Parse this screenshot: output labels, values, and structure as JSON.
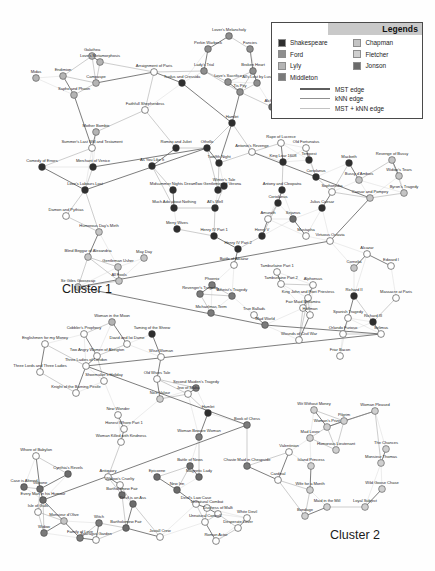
{
  "figure": {
    "type": "network-graph",
    "background": "#fefefe"
  },
  "legend": {
    "title": "Legends",
    "authors": [
      {
        "name": "Shakespeare",
        "color": "#2e2e2e"
      },
      {
        "name": "Ford",
        "color": "#8e8e8e"
      },
      {
        "name": "Lyly",
        "color": "#b4b4b4"
      },
      {
        "name": "Middleton",
        "color": "#7a7a7a"
      },
      {
        "name": "Chapman",
        "color": "#c4c4c4"
      },
      {
        "name": "Fletcher",
        "color": "#cfcfcf"
      },
      {
        "name": "Jonson",
        "color": "#6b6b6b"
      }
    ],
    "edges": [
      {
        "label": "MST edge",
        "color": "#5e5e5e"
      },
      {
        "label": "kNN edge",
        "color": "#8f8f8f"
      },
      {
        "label": "MST + kNN edge",
        "color": "#c2c2c2"
      }
    ]
  },
  "clusters": [
    {
      "label": "Cluster 1"
    },
    {
      "label": "Cluster 2"
    }
  ],
  "chart_data": {
    "type": "scatter",
    "title": "",
    "xlabel": "",
    "ylabel": "",
    "nodes": [
      {
        "label": "Galathea",
        "x": 92,
        "y": 56,
        "group": "Lyly"
      },
      {
        "label": "Love's Metamorphosis",
        "x": 100,
        "y": 62,
        "group": "Lyly"
      },
      {
        "label": "Endimion",
        "x": 63,
        "y": 76,
        "group": "Lyly"
      },
      {
        "label": "Midas",
        "x": 36,
        "y": 78,
        "group": "Lyly"
      },
      {
        "label": "Campaspe",
        "x": 96,
        "y": 83,
        "group": "Lyly"
      },
      {
        "label": "Sapho and Phaon",
        "x": 74,
        "y": 95,
        "group": "Lyly"
      },
      {
        "label": "Lover's Melancholy",
        "x": 229,
        "y": 36,
        "group": "Ford"
      },
      {
        "label": "Perkin Warbeck",
        "x": 208,
        "y": 49,
        "group": "Ford"
      },
      {
        "label": "Fancies",
        "x": 250,
        "y": 49,
        "group": "Ford"
      },
      {
        "label": "Lady's Trial",
        "x": 204,
        "y": 71,
        "group": "Ford"
      },
      {
        "label": "Broken Heart",
        "x": 253,
        "y": 71,
        "group": "Ford"
      },
      {
        "label": "Love's Sacrifice",
        "x": 228,
        "y": 82,
        "group": "Ford"
      },
      {
        "label": "All's Lost by Lust",
        "x": 257,
        "y": 83,
        "group": "Ford"
      },
      {
        "label": "Tis Pity",
        "x": 240,
        "y": 92,
        "group": "Ford"
      },
      {
        "label": "Arraignment of Paris",
        "x": 154,
        "y": 72,
        "group": "Other"
      },
      {
        "label": "Troilus and Cressida",
        "x": 182,
        "y": 83,
        "group": "Shakespeare"
      },
      {
        "label": "Faithfull Shepherdess",
        "x": 145,
        "y": 110,
        "group": "Other"
      },
      {
        "label": "Alcharist",
        "x": 272,
        "y": 107,
        "group": "Jonson"
      },
      {
        "label": "Hamlet",
        "x": 232,
        "y": 123,
        "group": "Shakespeare"
      },
      {
        "label": "Mother Bombie",
        "x": 96,
        "y": 132,
        "group": "Lyly"
      },
      {
        "label": "Summer's Last Will and Testament",
        "x": 92,
        "y": 148,
        "group": "Other"
      },
      {
        "label": "Comedy of Errors",
        "x": 42,
        "y": 167,
        "group": "Shakespeare"
      },
      {
        "label": "Merchant of Venice",
        "x": 93,
        "y": 167,
        "group": "Shakespeare"
      },
      {
        "label": "Love's Labours Lost",
        "x": 85,
        "y": 190,
        "group": "Shakespeare"
      },
      {
        "label": "Damon and Pythias",
        "x": 66,
        "y": 216,
        "group": "Other"
      },
      {
        "label": "Romeo and Juliet",
        "x": 176,
        "y": 148,
        "group": "Shakespeare"
      },
      {
        "label": "Othello",
        "x": 207,
        "y": 148,
        "group": "Shakespeare"
      },
      {
        "label": "As You Like It",
        "x": 152,
        "y": 166,
        "group": "Shakespeare"
      },
      {
        "label": "Twelfth Night",
        "x": 219,
        "y": 163,
        "group": "Shakespeare"
      },
      {
        "label": "Midsummer Nights Dream",
        "x": 173,
        "y": 190,
        "group": "Shakespeare"
      },
      {
        "label": "Two Gentlemen of Verona",
        "x": 218,
        "y": 190,
        "group": "Shakespeare"
      },
      {
        "label": "Much Ado about Nothing",
        "x": 174,
        "y": 208,
        "group": "Shakespeare"
      },
      {
        "label": "All's Well",
        "x": 215,
        "y": 208,
        "group": "Shakespeare"
      },
      {
        "label": "Winter's Tale",
        "x": 224,
        "y": 186,
        "group": "Shakespeare"
      },
      {
        "label": "Merry Wives",
        "x": 177,
        "y": 229,
        "group": "Shakespeare"
      },
      {
        "label": "Rape of Lucrece",
        "x": 281,
        "y": 143,
        "group": "Other"
      },
      {
        "label": "Old Fortunatus",
        "x": 306,
        "y": 148,
        "group": "Other"
      },
      {
        "label": "Antonio's Revenge",
        "x": 252,
        "y": 152,
        "group": "Other"
      },
      {
        "label": "King Lear 1608",
        "x": 283,
        "y": 162,
        "group": "Shakespeare"
      },
      {
        "label": "Tempest",
        "x": 309,
        "y": 160,
        "group": "Shakespeare"
      },
      {
        "label": "Coriolanus",
        "x": 316,
        "y": 177,
        "group": "Shakespeare"
      },
      {
        "label": "Macbeth",
        "x": 349,
        "y": 163,
        "group": "Shakespeare"
      },
      {
        "label": "Revenge of Bussy",
        "x": 392,
        "y": 160,
        "group": "Chapman"
      },
      {
        "label": "Bussy d'Ambois",
        "x": 359,
        "y": 180,
        "group": "Chapman"
      },
      {
        "label": "Widow's Tears",
        "x": 399,
        "y": 176,
        "group": "Chapman"
      },
      {
        "label": "Sophonisba",
        "x": 332,
        "y": 192,
        "group": "Other"
      },
      {
        "label": "Byron's Tragedy",
        "x": 404,
        "y": 193,
        "group": "Chapman"
      },
      {
        "label": "Caesar and Pompey",
        "x": 370,
        "y": 198,
        "group": "Chapman"
      },
      {
        "label": "Antony and Cleopatra",
        "x": 282,
        "y": 190,
        "group": "Shakespeare"
      },
      {
        "label": "Coriolanus",
        "x": 278,
        "y": 203,
        "group": "Shakespeare"
      },
      {
        "label": "Julius Caesar",
        "x": 322,
        "y": 208,
        "group": "Shakespeare"
      },
      {
        "label": "Sejanus",
        "x": 293,
        "y": 219,
        "group": "Jonson"
      },
      {
        "label": "Amurath",
        "x": 268,
        "y": 219,
        "group": "Other"
      },
      {
        "label": "Mustapha",
        "x": 306,
        "y": 236,
        "group": "Other"
      },
      {
        "label": "Henry IV Part 1",
        "x": 214,
        "y": 236,
        "group": "Shakespeare"
      },
      {
        "label": "Henry V",
        "x": 262,
        "y": 236,
        "group": "Shakespeare"
      },
      {
        "label": "Henry IV Part 2",
        "x": 238,
        "y": 249,
        "group": "Shakespeare"
      },
      {
        "label": "Virtuous Octavia",
        "x": 330,
        "y": 241,
        "group": "Other"
      },
      {
        "label": "Humorous Day's Mirth",
        "x": 99,
        "y": 232,
        "group": "Chapman"
      },
      {
        "label": "Blind Beggar of Alexandria",
        "x": 88,
        "y": 257,
        "group": "Chapman"
      },
      {
        "label": "Gentleman Usher",
        "x": 118,
        "y": 267,
        "group": "Chapman"
      },
      {
        "label": "May Day",
        "x": 144,
        "y": 258,
        "group": "Chapman"
      },
      {
        "label": "All Fools",
        "x": 119,
        "y": 281,
        "group": "Chapman"
      },
      {
        "label": "Sir Giles Goosecap",
        "x": 78,
        "y": 287,
        "group": "Chapman"
      },
      {
        "label": "Battle of Alcazar",
        "x": 234,
        "y": 265,
        "group": "Other"
      },
      {
        "label": "Tamburlaine Part 1",
        "x": 277,
        "y": 272,
        "group": "Other"
      },
      {
        "label": "Tamburlaine Part 2",
        "x": 281,
        "y": 284,
        "group": "Other"
      },
      {
        "label": "Phoenix",
        "x": 212,
        "y": 285,
        "group": "Middleton"
      },
      {
        "label": "Revenger's Tragedy",
        "x": 200,
        "y": 294,
        "group": "Middleton"
      },
      {
        "label": "Atheist's Tragedy",
        "x": 232,
        "y": 296,
        "group": "Middleton"
      },
      {
        "label": "Michaelmas Term",
        "x": 211,
        "y": 313,
        "group": "Middleton"
      },
      {
        "label": "True Ballads",
        "x": 254,
        "y": 315,
        "group": "Other"
      },
      {
        "label": "Mad World",
        "x": 265,
        "y": 325,
        "group": "Middleton"
      },
      {
        "label": "Alphonsus",
        "x": 313,
        "y": 285,
        "group": "Other"
      },
      {
        "label": "King John and Poet Priestess",
        "x": 308,
        "y": 298,
        "group": "Other"
      },
      {
        "label": "Fair Maid Bellamira",
        "x": 303,
        "y": 308,
        "group": "Other"
      },
      {
        "label": "Edward I",
        "x": 391,
        "y": 266,
        "group": "Other"
      },
      {
        "label": "Cornelia",
        "x": 354,
        "y": 268,
        "group": "Chapman"
      },
      {
        "label": "Alcazar",
        "x": 367,
        "y": 254,
        "group": "Other"
      },
      {
        "label": "Richard II",
        "x": 354,
        "y": 296,
        "group": "Shakespeare"
      },
      {
        "label": "Massacre at Paris",
        "x": 396,
        "y": 298,
        "group": "Other"
      },
      {
        "label": "Spanish Tragedy",
        "x": 348,
        "y": 318,
        "group": "Other"
      },
      {
        "label": "Richard III",
        "x": 373,
        "y": 322,
        "group": "Shakespeare"
      },
      {
        "label": "Hoffman",
        "x": 310,
        "y": 315,
        "group": "Other"
      },
      {
        "label": "Orlando Furioso",
        "x": 343,
        "y": 334,
        "group": "Other"
      },
      {
        "label": "Selimus",
        "x": 381,
        "y": 334,
        "group": "Other"
      },
      {
        "label": "Wounds of Civil War",
        "x": 299,
        "y": 340,
        "group": "Other"
      },
      {
        "label": "Friar Bacon",
        "x": 340,
        "y": 356,
        "group": "Other"
      },
      {
        "label": "Woman in the Moon",
        "x": 112,
        "y": 322,
        "group": "Lyly"
      },
      {
        "label": "Cobbler's Prophecy",
        "x": 84,
        "y": 334,
        "group": "Other"
      },
      {
        "label": "Taming of the Shrew",
        "x": 152,
        "y": 334,
        "group": "Shakespeare"
      },
      {
        "label": "Englishmen for my Money",
        "x": 45,
        "y": 344,
        "group": "Other"
      },
      {
        "label": "David and Ioi Dame",
        "x": 127,
        "y": 344,
        "group": "Other"
      },
      {
        "label": "Two Angry Women of Abington",
        "x": 97,
        "y": 356,
        "group": "Other"
      },
      {
        "label": "Wise Woman",
        "x": 161,
        "y": 357,
        "group": "Other"
      },
      {
        "label": "Three Ladies of London",
        "x": 86,
        "y": 366,
        "group": "Other"
      },
      {
        "label": "Three Lords and Three Ladies",
        "x": 40,
        "y": 372,
        "group": "Other"
      },
      {
        "label": "Shoemaker's Holiday",
        "x": 104,
        "y": 381,
        "group": "Other"
      },
      {
        "label": "Old Wives Tale",
        "x": 157,
        "y": 379,
        "group": "Other"
      },
      {
        "label": "Knight of the Burning Pestle",
        "x": 76,
        "y": 393,
        "group": "Other"
      },
      {
        "label": "Jew of Malta",
        "x": 188,
        "y": 394,
        "group": "Other"
      },
      {
        "label": "Nice Valour",
        "x": 160,
        "y": 399,
        "group": "Fletcher"
      },
      {
        "label": "New Wonder",
        "x": 118,
        "y": 415,
        "group": "Other"
      },
      {
        "label": "Hamlet",
        "x": 208,
        "y": 413,
        "group": "Shakespeare"
      },
      {
        "label": "Honest Whore Part 1",
        "x": 124,
        "y": 429,
        "group": "Other"
      },
      {
        "label": "Second Maiden's Tragedy",
        "x": 196,
        "y": 388,
        "group": "Middleton"
      },
      {
        "label": "Woman Killed with Kindness",
        "x": 121,
        "y": 442,
        "group": "Other"
      },
      {
        "label": "Woman Beware Woman",
        "x": 199,
        "y": 437,
        "group": "Middleton"
      },
      {
        "label": "Book of Chess",
        "x": 247,
        "y": 425,
        "group": "Middleton"
      },
      {
        "label": "Whore of Babylon",
        "x": 36,
        "y": 456,
        "group": "Other"
      },
      {
        "label": "Battle of News",
        "x": 190,
        "y": 466,
        "group": "Jonson"
      },
      {
        "label": "Chaste Maid in Cheapside",
        "x": 247,
        "y": 466,
        "group": "Middleton"
      },
      {
        "label": "Cynthia's Revels",
        "x": 68,
        "y": 474,
        "group": "Jonson"
      },
      {
        "label": "Antiquary",
        "x": 108,
        "y": 477,
        "group": "Other"
      },
      {
        "label": "Epicoene",
        "x": 157,
        "y": 477,
        "group": "Jonson"
      },
      {
        "label": "Magnetic Lady",
        "x": 199,
        "y": 477,
        "group": "Jonson"
      },
      {
        "label": "Cardinal",
        "x": 278,
        "y": 480,
        "group": "Other"
      },
      {
        "label": "Volpone",
        "x": 40,
        "y": 489,
        "group": "Jonson"
      },
      {
        "label": "New Inn",
        "x": 177,
        "y": 490,
        "group": "Jonson"
      },
      {
        "label": "Case is Altered",
        "x": 24,
        "y": 487,
        "group": "Jonson"
      },
      {
        "label": "Every Man in his Humour",
        "x": 43,
        "y": 500,
        "group": "Jonson"
      },
      {
        "label": "Bartholomew Fair",
        "x": 122,
        "y": 495,
        "group": "Jonson"
      },
      {
        "label": "Devil is an Ass",
        "x": 133,
        "y": 504,
        "group": "Jonson"
      },
      {
        "label": "Devil's Law Case",
        "x": 196,
        "y": 504,
        "group": "Other"
      },
      {
        "label": "Isle of Gulls",
        "x": 38,
        "y": 512,
        "group": "Other"
      },
      {
        "label": "Duchess of Malfi",
        "x": 218,
        "y": 514,
        "group": "Other"
      },
      {
        "label": "Monsieur d'Olive",
        "x": 64,
        "y": 521,
        "group": "Chapman"
      },
      {
        "label": "White Devil",
        "x": 247,
        "y": 518,
        "group": "Other"
      },
      {
        "label": "Witch",
        "x": 99,
        "y": 523,
        "group": "Middleton"
      },
      {
        "label": "Widow's Cruelty",
        "x": 120,
        "y": 485,
        "group": "Other"
      },
      {
        "label": "Bartholomew Fair",
        "x": 126,
        "y": 528,
        "group": "Jonson"
      },
      {
        "label": "Widow",
        "x": 44,
        "y": 533,
        "group": "Middleton"
      },
      {
        "label": "Family of Love",
        "x": 80,
        "y": 538,
        "group": "Middleton"
      },
      {
        "label": "Sparagus Garden",
        "x": 96,
        "y": 540,
        "group": "Other"
      },
      {
        "label": "Joviall Crew",
        "x": 160,
        "y": 537,
        "group": "Other"
      },
      {
        "label": "Unnatural Combat",
        "x": 207,
        "y": 508,
        "group": "Other"
      },
      {
        "label": "Unnatural Controll",
        "x": 205,
        "y": 522,
        "group": "Other"
      },
      {
        "label": "Desperate Lover",
        "x": 238,
        "y": 528,
        "group": "Other"
      },
      {
        "label": "Roman Actor",
        "x": 216,
        "y": 541,
        "group": "Other"
      },
      {
        "label": "Wit Without Money",
        "x": 314,
        "y": 410,
        "group": "Fletcher"
      },
      {
        "label": "Woman Pleased",
        "x": 375,
        "y": 411,
        "group": "Fletcher"
      },
      {
        "label": "Pilgrim",
        "x": 344,
        "y": 421,
        "group": "Fletcher"
      },
      {
        "label": "Woman's Prize",
        "x": 327,
        "y": 427,
        "group": "Fletcher"
      },
      {
        "label": "Mad Lover",
        "x": 310,
        "y": 438,
        "group": "Fletcher"
      },
      {
        "label": "Humorous Lieutenant",
        "x": 336,
        "y": 450,
        "group": "Fletcher"
      },
      {
        "label": "The Chances",
        "x": 386,
        "y": 449,
        "group": "Fletcher"
      },
      {
        "label": "Valentinian",
        "x": 289,
        "y": 452,
        "group": "Other"
      },
      {
        "label": "Island Princess",
        "x": 311,
        "y": 466,
        "group": "Fletcher"
      },
      {
        "label": "Monsieur Thomas",
        "x": 381,
        "y": 463,
        "group": "Fletcher"
      },
      {
        "label": "Wife for a Month",
        "x": 310,
        "y": 490,
        "group": "Fletcher"
      },
      {
        "label": "Wild Goose Chase",
        "x": 382,
        "y": 489,
        "group": "Fletcher"
      },
      {
        "label": "Maid in the Mill",
        "x": 327,
        "y": 507,
        "group": "Fletcher"
      },
      {
        "label": "Loyal Subject",
        "x": 365,
        "y": 507,
        "group": "Fletcher"
      },
      {
        "label": "Bondage",
        "x": 305,
        "y": 516,
        "group": "Fletcher"
      }
    ]
  }
}
